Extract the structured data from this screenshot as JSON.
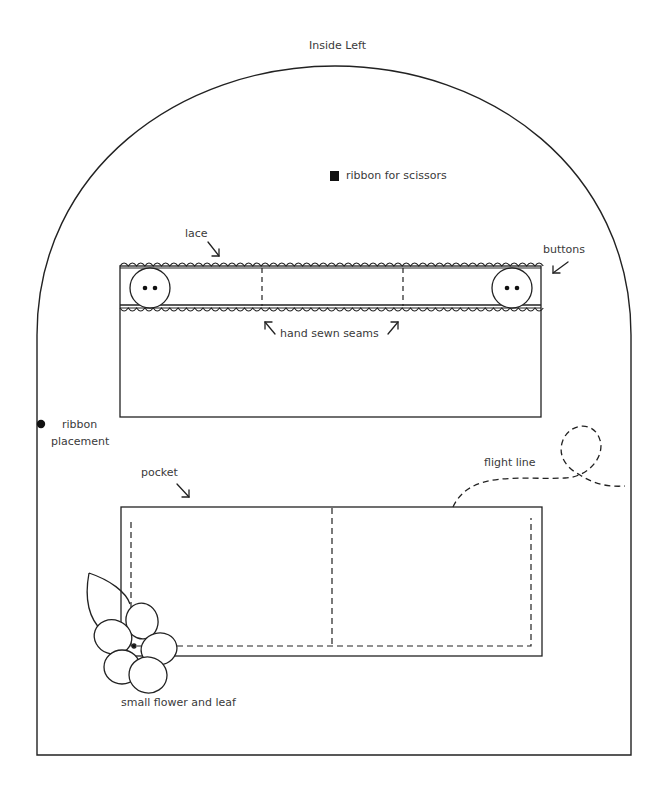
{
  "title": "Inside Left",
  "labels": {
    "ribbon_scissors": "ribbon for scissors",
    "lace": "lace",
    "buttons": "buttons",
    "hand_sewn_seams": "hand sewn seams",
    "ribbon_placement_line1": "ribbon",
    "ribbon_placement_line2": "placement",
    "pocket": "pocket",
    "flight_line": "flight line",
    "small_flower": "small flower and leaf"
  },
  "colors": {
    "stroke": "#222222",
    "text": "#3a3a3a",
    "background": "#ffffff"
  }
}
